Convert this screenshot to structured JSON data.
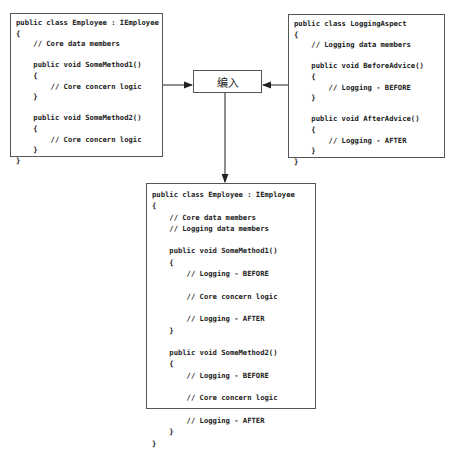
{
  "diagram": {
    "type": "aop-weaving",
    "left_box": {
      "title": "Employee class (core)",
      "lines": [
        "public class Employee : IEmployee",
        "{",
        "    // Core data members",
        "",
        "    public void SomeMethod1()",
        "    {",
        "        // Core concern logic",
        "    }",
        "",
        "    public void SomeMethod2()",
        "    {",
        "        // Core concern logic",
        "    }",
        "}"
      ]
    },
    "right_box": {
      "title": "LoggingAspect class",
      "lines": [
        "public class LoggingAspect",
        "{",
        "    // Logging data members",
        "",
        "    public void BeforeAdvice()",
        "    {",
        "        // Logging - BEFORE",
        "    }",
        "",
        "    public void AfterAdvice()",
        "    {",
        "        // Logging - AFTER",
        "    }",
        "}"
      ]
    },
    "weave_node": {
      "label": "编入"
    },
    "result_box": {
      "title": "Woven Employee class",
      "lines": [
        "public class Employee : IEmployee",
        "{",
        "    // Core data members",
        "    // Logging data members",
        "",
        "    public void SomeMethod1()",
        "    {",
        "        // Logging - BEFORE",
        "",
        "        // Core concern logic",
        "",
        "        // Logging - AFTER",
        "    }",
        "",
        "    public void SomeMethod2()",
        "    {",
        "        // Logging - BEFORE",
        "",
        "        // Core concern logic",
        "",
        "        // Logging - AFTER",
        "    }",
        "}"
      ]
    },
    "edges": [
      {
        "from": "left_box",
        "to": "weave_node"
      },
      {
        "from": "right_box",
        "to": "weave_node"
      },
      {
        "from": "weave_node",
        "to": "result_box"
      }
    ]
  }
}
